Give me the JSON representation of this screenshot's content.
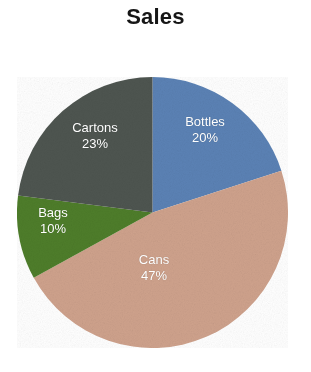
{
  "chart_data": {
    "type": "pie",
    "title": "Sales",
    "xlabel": "",
    "ylabel": "",
    "categories": [
      "Bottles",
      "Cans",
      "Bags",
      "Cartons"
    ],
    "values": [
      20,
      47,
      10,
      23
    ],
    "value_unit": "%",
    "start_angle_deg": 0,
    "direction": "clockwise",
    "legend": "none",
    "grid": false,
    "labels_inside": true,
    "slices": [
      {
        "name": "Bottles",
        "value": 20,
        "percent_label": "20%",
        "color": "#5b82b5",
        "label_color": "#ffffff"
      },
      {
        "name": "Cans",
        "value": 47,
        "percent_label": "47%",
        "color": "#cfa28c",
        "label_color": "#ffffff"
      },
      {
        "name": "Bags",
        "value": 10,
        "percent_label": "10%",
        "color": "#4e7d2a",
        "label_color": "#ffffff"
      },
      {
        "name": "Cartons",
        "value": 23,
        "percent_label": "23%",
        "color": "#4e5550",
        "label_color": "#ffffff"
      }
    ]
  },
  "title": {
    "text": "Sales",
    "color": "#161616"
  },
  "labels": {
    "bottles": {
      "name": "Bottles",
      "percent": "20%"
    },
    "cartons": {
      "name": "Cartons",
      "percent": "23%"
    },
    "bags": {
      "name": "Bags",
      "percent": "10%"
    },
    "cans": {
      "name": "Cans",
      "percent": "47%"
    }
  },
  "colors": {
    "background": "#ffffff",
    "bottles": "#5b82b5",
    "cans": "#cfa28c",
    "bags": "#4e7d2a",
    "cartons": "#4e5550",
    "label_text": "#ffffff"
  }
}
